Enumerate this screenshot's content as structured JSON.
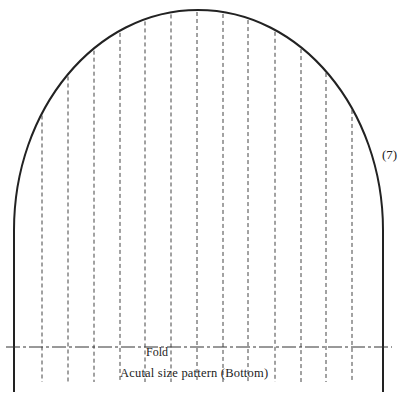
{
  "pattern": {
    "number_label": "(7)",
    "fold_label": "Fold",
    "caption": "Acutal size pattern  (Bottom)",
    "outline_color": "#222222",
    "dash_color": "#444444",
    "pleat_line_count": 13
  }
}
